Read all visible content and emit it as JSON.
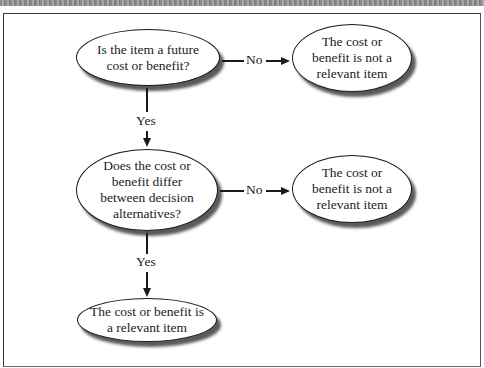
{
  "diagram": {
    "type": "decision-flowchart",
    "nodes": {
      "q1": {
        "label": "Is the item a future\ncost or benefit?",
        "shape": "ellipse",
        "role": "decision"
      },
      "r1": {
        "label": "The cost or\nbenefit is not a\nrelevant item",
        "shape": "ellipse",
        "role": "outcome"
      },
      "q2": {
        "label": "Does the cost or\nbenefit differ\nbetween decision\nalternatives?",
        "shape": "ellipse",
        "role": "decision"
      },
      "r2": {
        "label": "The cost or\nbenefit is not a\nrelevant item",
        "shape": "ellipse",
        "role": "outcome"
      },
      "r3": {
        "label": "The cost or benefit is\na relevant item",
        "shape": "ellipse",
        "role": "outcome"
      }
    },
    "edges": {
      "q1_no": {
        "from": "q1",
        "to": "r1",
        "label": "No"
      },
      "q1_yes": {
        "from": "q1",
        "to": "q2",
        "label": "Yes"
      },
      "q2_no": {
        "from": "q2",
        "to": "r2",
        "label": "No"
      },
      "q2_yes": {
        "from": "q2",
        "to": "r3",
        "label": "Yes"
      }
    },
    "colors": {
      "stroke": "#1a1a1a",
      "shadow": "#5a5a5a",
      "background": "#ffffff"
    }
  }
}
